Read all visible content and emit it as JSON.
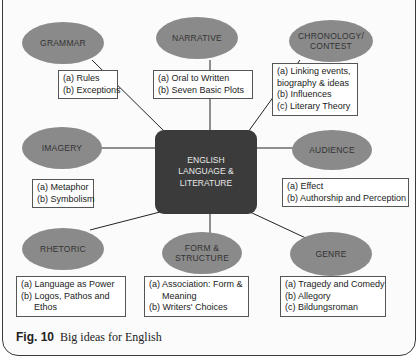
{
  "center": {
    "line1": "ENGLISH",
    "line2": "LANGUAGE &",
    "line3": "LITERATURE"
  },
  "nodes": {
    "grammar": {
      "label": "GRAMMAR",
      "items": [
        "(a) Rules",
        "(b) Exceptions"
      ]
    },
    "narrative": {
      "label": "NARRATIVE",
      "items": [
        "(a) Oral to Written",
        "(b) Seven Basic Plots"
      ]
    },
    "chronology": {
      "label1": "CHRONOLOGY/",
      "label2": "CONTEST",
      "items": [
        "(a) Linking events,",
        "biography & ideas",
        "(b) Influences",
        "(c) Literary Theory"
      ]
    },
    "imagery": {
      "label": "IMAGERY",
      "items": [
        "(a) Metaphor",
        "(b) Symbolism"
      ]
    },
    "audience": {
      "label": "AUDIENCE",
      "items": [
        "(a) Effect",
        "(b) Authorship and Perception"
      ]
    },
    "rhetoric": {
      "label": "RHETORIC",
      "items": [
        "(a) Language as Power",
        "(b) Logos, Pathos and",
        "Ethos"
      ]
    },
    "form": {
      "label1": "FORM &",
      "label2": "STRUCTURE",
      "items": [
        "(a) Association: Form &",
        "Meaning",
        "(b) Writers' Choices"
      ]
    },
    "genre": {
      "label": "GENRE",
      "items": [
        "(a) Tragedy and Comedy",
        "(b) Allegory",
        "(c) Bildungsroman"
      ]
    }
  },
  "caption": {
    "fig": "Fig. 10",
    "text": "Big ideas for English"
  },
  "colors": {
    "oval": "#8a8a8a",
    "center": "#3b3b3b",
    "border": "#3a3a3a"
  }
}
